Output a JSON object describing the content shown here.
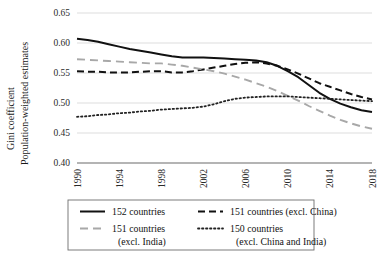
{
  "chart_data": {
    "type": "line",
    "title": "",
    "xlabel": "",
    "ylabel_line1": "Gini coefficient",
    "ylabel_line2": "Population-weighted estimates",
    "grid": "horizontal",
    "legend_position": "bottom",
    "xlim": [
      1990,
      2018
    ],
    "ylim": [
      0.4,
      0.65
    ],
    "ytick_labels": [
      "0.65",
      "0.60",
      "0.55",
      "0.50",
      "0.45",
      "0.40"
    ],
    "ytick_values": [
      0.65,
      0.6,
      0.55,
      0.5,
      0.45,
      0.4
    ],
    "xtick_labels": [
      "1990",
      "1994",
      "1998",
      "2002",
      "2006",
      "2010",
      "2014",
      "2018"
    ],
    "xtick_values": [
      1990,
      1994,
      1998,
      2002,
      2006,
      2010,
      2014,
      2018
    ],
    "x": [
      1990,
      1991,
      1992,
      1993,
      1994,
      1995,
      1996,
      1997,
      1998,
      1999,
      2000,
      2001,
      2002,
      2003,
      2004,
      2005,
      2006,
      2007,
      2008,
      2009,
      2010,
      2011,
      2012,
      2013,
      2014,
      2015,
      2016,
      2017,
      2018
    ],
    "series": [
      {
        "name": "152 countries",
        "key": "152-countries",
        "style": "solid",
        "color": "#111111",
        "width": 2.0,
        "values": [
          0.607,
          0.605,
          0.602,
          0.598,
          0.594,
          0.59,
          0.587,
          0.584,
          0.581,
          0.578,
          0.576,
          0.576,
          0.576,
          0.575,
          0.574,
          0.573,
          0.572,
          0.571,
          0.568,
          0.562,
          0.553,
          0.543,
          0.53,
          0.517,
          0.507,
          0.499,
          0.493,
          0.488,
          0.485
        ]
      },
      {
        "name": "151 countries (excl. China)",
        "key": "151-countries-excl-china",
        "style": "dashed",
        "color": "#111111",
        "width": 2.0,
        "values": [
          0.553,
          0.552,
          0.552,
          0.551,
          0.551,
          0.551,
          0.552,
          0.553,
          0.553,
          0.551,
          0.551,
          0.553,
          0.556,
          0.559,
          0.562,
          0.565,
          0.567,
          0.568,
          0.566,
          0.562,
          0.556,
          0.549,
          0.541,
          0.533,
          0.527,
          0.521,
          0.515,
          0.51,
          0.506
        ]
      },
      {
        "name": "151 countries (excl. India)",
        "key": "151-countries-excl-india",
        "style": "dashed-gray",
        "color": "#a8a8a8",
        "width": 1.9,
        "values": [
          0.573,
          0.572,
          0.571,
          0.57,
          0.569,
          0.568,
          0.567,
          0.566,
          0.566,
          0.564,
          0.562,
          0.559,
          0.556,
          0.553,
          0.549,
          0.544,
          0.539,
          0.533,
          0.527,
          0.52,
          0.512,
          0.504,
          0.495,
          0.487,
          0.479,
          0.472,
          0.466,
          0.461,
          0.457
        ]
      },
      {
        "name": "150 countries (excl. China and India)",
        "key": "150-countries-excl-china-and-india",
        "style": "dotted",
        "color": "#222222",
        "width": 1.8,
        "values": [
          0.477,
          0.478,
          0.48,
          0.481,
          0.483,
          0.484,
          0.486,
          0.487,
          0.489,
          0.49,
          0.491,
          0.492,
          0.494,
          0.498,
          0.503,
          0.507,
          0.509,
          0.51,
          0.511,
          0.511,
          0.511,
          0.51,
          0.509,
          0.508,
          0.507,
          0.506,
          0.505,
          0.504,
          0.503
        ]
      }
    ],
    "legend_entries": [
      {
        "label": "152 countries",
        "style": "solid",
        "color": "#111111",
        "key": "152-countries"
      },
      {
        "label": "151 countries (excl. China)",
        "style": "dashed",
        "color": "#111111",
        "key": "151-countries-excl-china"
      },
      {
        "label": "151 countries",
        "label2": "(excl. India)",
        "style": "dashed-gray",
        "color": "#a8a8a8",
        "key": "151-countries-excl-india"
      },
      {
        "label": "150 countries",
        "label2": "(excl. China and India)",
        "style": "dotted",
        "color": "#222222",
        "key": "150-countries-excl-china-and-india"
      }
    ]
  }
}
